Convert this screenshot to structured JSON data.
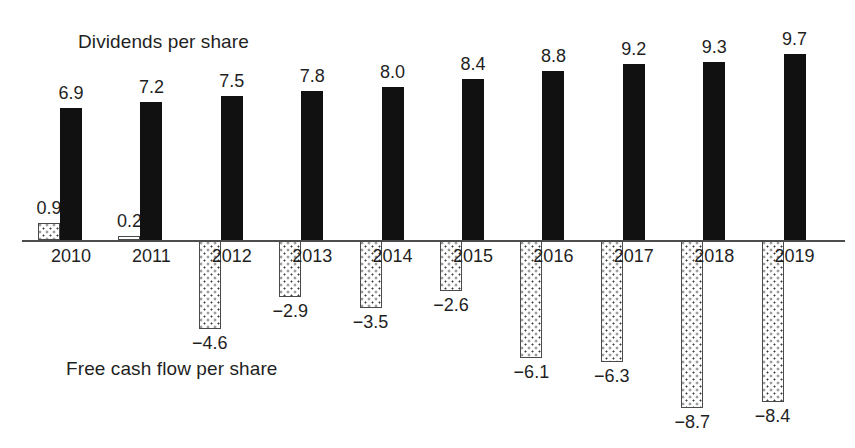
{
  "chart_data": {
    "type": "bar",
    "title": "",
    "xlabel": "",
    "ylabel": "",
    "ylim": [
      -9.5,
      10.2
    ],
    "grid": false,
    "legend_position": "inline-annotations",
    "categories": [
      "2010",
      "2011",
      "2012",
      "2013",
      "2014",
      "2015",
      "2016",
      "2017",
      "2018",
      "2019"
    ],
    "series": [
      {
        "name": "Dividends per share",
        "style": "solid-black",
        "values": [
          6.9,
          7.2,
          7.5,
          7.8,
          8.0,
          8.4,
          8.8,
          9.2,
          9.3,
          9.7
        ],
        "value_labels": [
          "6.9",
          "7.2",
          "7.5",
          "7.8",
          "8.0",
          "8.4",
          "8.8",
          "9.2",
          "9.3",
          "9.7"
        ]
      },
      {
        "name": "Free cash flow per share",
        "style": "dotted-stipple",
        "values": [
          0.9,
          0.2,
          -4.6,
          -2.9,
          -3.5,
          -2.6,
          -6.1,
          -6.3,
          -8.7,
          -8.4
        ],
        "value_labels": [
          "0.9",
          "0.2",
          "−4.6",
          "−2.9",
          "−3.5",
          "−2.6",
          "−6.1",
          "−6.3",
          "−8.7",
          "−8.4"
        ]
      }
    ],
    "annotations": [
      {
        "text": "Dividends per share",
        "position": "top-left"
      },
      {
        "text": "Free cash flow per share",
        "position": "bottom-left"
      }
    ]
  },
  "colors": {
    "dividends_bar": "#111111",
    "free_cash_flow_bar_fill": "#ffffff",
    "free_cash_flow_bar_stroke": "#4a4a4a",
    "axis": "#4d4d4d",
    "text": "#1f1f1f"
  }
}
